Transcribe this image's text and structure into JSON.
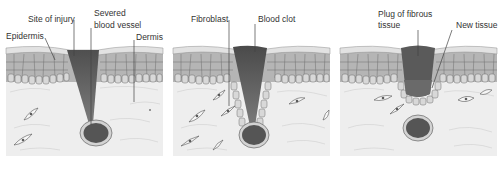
{
  "colors": {
    "epidermis_cell_fill": "#a9a9a9",
    "epidermis_cell_stroke": "#6f6f6f",
    "epidermis_surface": "#dcdcdc",
    "basal_cell_fill": "#d6d6d6",
    "dermis_fill": "#eeeeee",
    "wound_dark": "#5a5a5a",
    "wound_light": "#8a8a8a",
    "vessel_fill": "#555555",
    "vessel_ring": "#cfcfcf",
    "leader_line": "#444444",
    "text": "#333333"
  },
  "panels": [
    {
      "id": "stage-1-injury",
      "labels": {
        "site_of_injury": "Site of injury",
        "severed_blood_vessel_line1": "Severed",
        "severed_blood_vessel_line2": "blood vessel",
        "epidermis": "Epidermis",
        "dermis": "Dermis"
      }
    },
    {
      "id": "stage-2-clot",
      "labels": {
        "fibroblast": "Fibroblast",
        "blood_clot": "Blood clot"
      }
    },
    {
      "id": "stage-3-repair",
      "labels": {
        "plug_line1": "Plug of fibrous",
        "plug_line2": "tissue",
        "new_tissue": "New tissue"
      }
    }
  ]
}
